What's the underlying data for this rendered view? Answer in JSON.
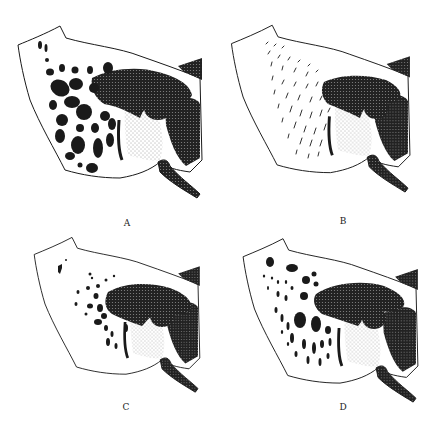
{
  "figure": {
    "panels": [
      {
        "id": "A",
        "label": "A",
        "pattern": "large-cells",
        "label_x": 127,
        "label_y": 218
      },
      {
        "id": "B",
        "label": "B",
        "pattern": "fine-streaks",
        "label_x": 343,
        "label_y": 216
      },
      {
        "id": "C",
        "label": "C",
        "pattern": "sparse-cells",
        "label_x": 126,
        "label_y": 402
      },
      {
        "id": "D",
        "label": "D",
        "pattern": "mixed-cells",
        "label_x": 343,
        "label_y": 402
      }
    ],
    "colors": {
      "ink": "#1a1a1a",
      "paper": "#ffffff",
      "stipple": "#555555"
    }
  }
}
